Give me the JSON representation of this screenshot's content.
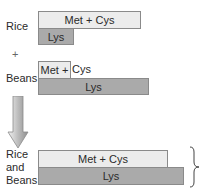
{
  "groups": {
    "rice": {
      "label": "Rice",
      "met_cys": "Met + Cys",
      "lys": "Lys"
    },
    "plus": "+",
    "beans": {
      "label": "Beans",
      "met_cys_in_box": "Met +",
      "met_cys_overflow": "Cys",
      "lys": "Lys"
    },
    "combined": {
      "label_line1": "Rice",
      "label_line2": "and",
      "label_line3": "Beans",
      "met_cys": "Met + Cys",
      "lys": "Lys"
    }
  },
  "icons": {
    "arrow": "down-arrow-icon",
    "brace": "right-brace-icon"
  },
  "colors": {
    "light_bar": "#ececec",
    "dark_bar": "#aaaaaa",
    "border": "#8a8a8a"
  }
}
